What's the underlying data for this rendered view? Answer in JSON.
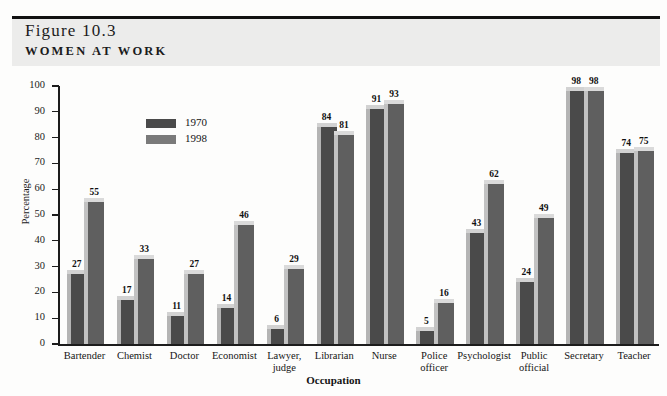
{
  "figure": {
    "number": "Figure 10.3",
    "title": "WOMEN AT WORK"
  },
  "chart_data": {
    "type": "bar",
    "title": "Women at Work",
    "xlabel": "Occupation",
    "ylabel": "Percentage",
    "ylim": [
      0,
      100
    ],
    "yticks": [
      0,
      10,
      20,
      30,
      40,
      50,
      60,
      70,
      80,
      90,
      100
    ],
    "grid": false,
    "legend_position": "upper-left-inside",
    "categories": [
      "Bartender",
      "Chemist",
      "Doctor",
      "Economist",
      "Lawyer, judge",
      "Librarian",
      "Nurse",
      "Police officer",
      "Psychologist",
      "Public official",
      "Secretary",
      "Teacher"
    ],
    "category_lines": [
      [
        "Bartender"
      ],
      [
        "Chemist"
      ],
      [
        "Doctor"
      ],
      [
        "Economist"
      ],
      [
        "Lawyer,",
        "judge"
      ],
      [
        "Librarian"
      ],
      [
        "Nurse"
      ],
      [
        "Police",
        "officer"
      ],
      [
        "Psychologist"
      ],
      [
        "Public",
        "official"
      ],
      [
        "Secretary"
      ],
      [
        "Teacher"
      ]
    ],
    "series": [
      {
        "name": "1970",
        "color": "#4a4a4a",
        "values": [
          27,
          17,
          11,
          14,
          6,
          84,
          91,
          5,
          43,
          24,
          98,
          74
        ]
      },
      {
        "name": "1998",
        "color": "#5f5f5f",
        "values": [
          55,
          33,
          27,
          46,
          29,
          81,
          93,
          16,
          62,
          49,
          98,
          75
        ]
      }
    ]
  }
}
